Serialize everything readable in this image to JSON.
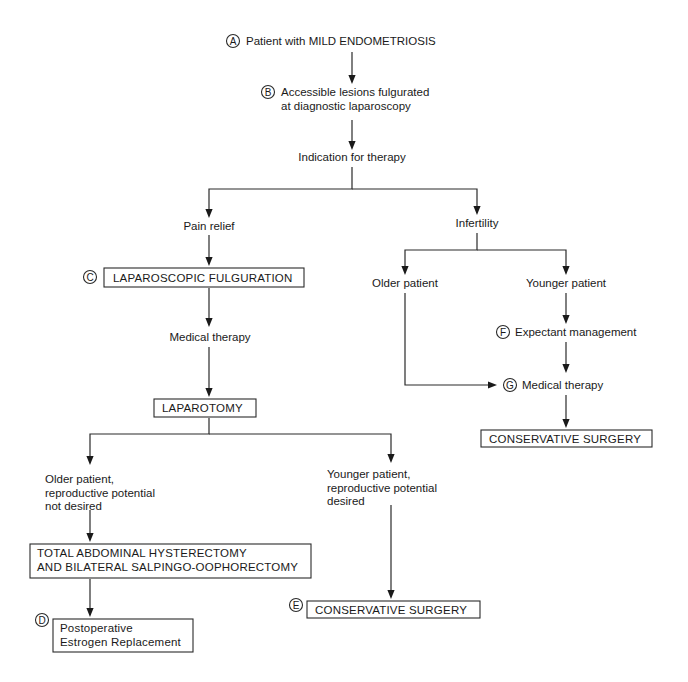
{
  "diagram": {
    "type": "flowchart",
    "topic": "Management of mild endometriosis",
    "nodes": [
      {
        "id": "start",
        "marker": "A",
        "lines": [
          "Patient with MILD ENDOMETRIOSIS"
        ],
        "boxed": false
      },
      {
        "id": "fulgurated",
        "marker": "B",
        "lines": [
          "Accessible lesions fulgurated",
          "at diagnostic laparoscopy"
        ],
        "boxed": false
      },
      {
        "id": "indication",
        "marker": "",
        "lines": [
          "Indication for therapy"
        ],
        "boxed": false
      },
      {
        "id": "pain",
        "marker": "",
        "lines": [
          "Pain relief"
        ],
        "boxed": false
      },
      {
        "id": "infertility",
        "marker": "",
        "lines": [
          "Infertility"
        ],
        "boxed": false
      },
      {
        "id": "lap-fulguration",
        "marker": "C",
        "lines": [
          "LAPAROSCOPIC FULGURATION"
        ],
        "boxed": true
      },
      {
        "id": "medical-left",
        "marker": "",
        "lines": [
          "Medical therapy"
        ],
        "boxed": false
      },
      {
        "id": "laparotomy",
        "marker": "",
        "lines": [
          "LAPAROTOMY"
        ],
        "boxed": true
      },
      {
        "id": "older-left",
        "marker": "",
        "lines": [
          "Older patient,",
          "reproductive potential",
          "not desired"
        ],
        "boxed": false
      },
      {
        "id": "younger-left",
        "marker": "",
        "lines": [
          "Younger patient,",
          "reproductive potential",
          "desired"
        ],
        "boxed": false
      },
      {
        "id": "tah",
        "marker": "",
        "lines": [
          "TOTAL ABDOMINAL HYSTERECTOMY",
          "AND BILATERAL SALPINGO-OOPHORECTOMY"
        ],
        "boxed": true
      },
      {
        "id": "estrogen",
        "marker": "D",
        "lines": [
          "Postoperative",
          "Estrogen Replacement"
        ],
        "boxed": true
      },
      {
        "id": "conservative-left",
        "marker": "E",
        "lines": [
          "CONSERVATIVE SURGERY"
        ],
        "boxed": true
      },
      {
        "id": "older-right",
        "marker": "",
        "lines": [
          "Older patient"
        ],
        "boxed": false
      },
      {
        "id": "younger-right",
        "marker": "",
        "lines": [
          "Younger patient"
        ],
        "boxed": false
      },
      {
        "id": "expectant",
        "marker": "F",
        "lines": [
          "Expectant management"
        ],
        "boxed": false
      },
      {
        "id": "medical-right",
        "marker": "G",
        "lines": [
          "Medical therapy"
        ],
        "boxed": false
      },
      {
        "id": "conservative-right",
        "marker": "",
        "lines": [
          "CONSERVATIVE SURGERY"
        ],
        "boxed": true
      }
    ],
    "edges": [
      {
        "from": "start",
        "to": "fulgurated"
      },
      {
        "from": "fulgurated",
        "to": "indication"
      },
      {
        "from": "indication",
        "to": "pain"
      },
      {
        "from": "indication",
        "to": "infertility"
      },
      {
        "from": "pain",
        "to": "lap-fulguration"
      },
      {
        "from": "lap-fulguration",
        "to": "medical-left"
      },
      {
        "from": "medical-left",
        "to": "laparotomy"
      },
      {
        "from": "laparotomy",
        "to": "older-left"
      },
      {
        "from": "laparotomy",
        "to": "younger-left"
      },
      {
        "from": "older-left",
        "to": "tah"
      },
      {
        "from": "tah",
        "to": "estrogen"
      },
      {
        "from": "younger-left",
        "to": "conservative-left"
      },
      {
        "from": "infertility",
        "to": "older-right"
      },
      {
        "from": "infertility",
        "to": "younger-right"
      },
      {
        "from": "younger-right",
        "to": "expectant"
      },
      {
        "from": "expectant",
        "to": "medical-right"
      },
      {
        "from": "older-right",
        "to": "medical-right"
      },
      {
        "from": "medical-right",
        "to": "conservative-right"
      }
    ]
  }
}
